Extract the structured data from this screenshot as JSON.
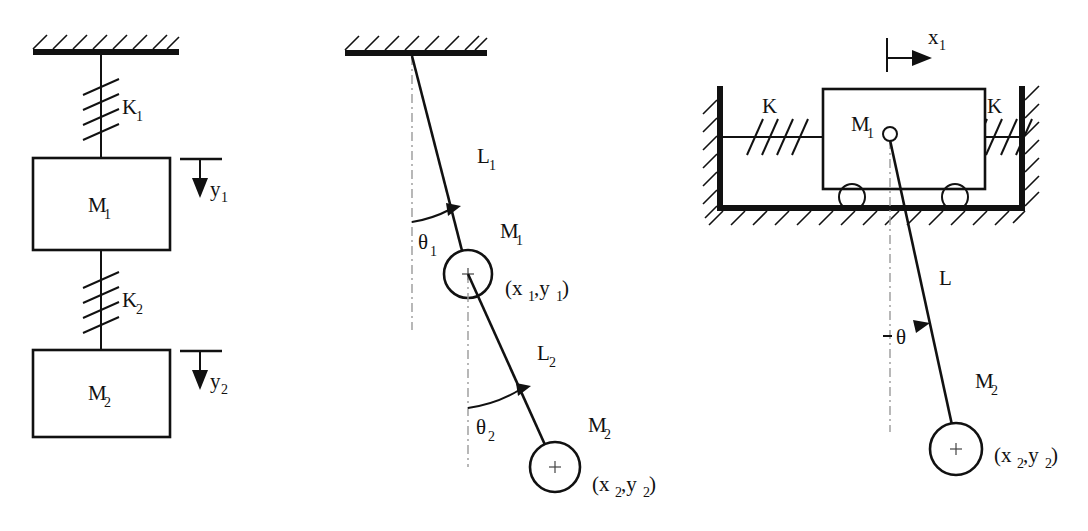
{
  "figure": {
    "title": "",
    "background_color": "#ffffff",
    "line_color": "#111111",
    "reference_line_color": "#9a9a9a"
  },
  "panels": [
    {
      "id": "panel-spring-mass",
      "name": "two-degree-of-freedom spring mass system",
      "labels": {
        "spring_1": "K",
        "spring_1_sub": "1",
        "spring_2": "K",
        "spring_2_sub": "2",
        "mass_1": "M",
        "mass_1_sub": "1",
        "mass_2": "M",
        "mass_2_sub": "2",
        "coord_1": "y",
        "coord_1_sub": "1",
        "coord_2": "y",
        "coord_2_sub": "2"
      }
    },
    {
      "id": "panel-double-pendulum",
      "name": "double pendulum",
      "labels": {
        "length_1": "L",
        "length_1_sub": "1",
        "length_2": "L",
        "length_2_sub": "2",
        "angle_1": "θ",
        "angle_1_sub": "1",
        "angle_2": "θ",
        "angle_2_sub": "2",
        "mass_1": "M",
        "mass_1_sub": "1",
        "mass_2": "M",
        "mass_2_sub": "2",
        "coord_1_open": "(x",
        "coord_1_sub_a": "1",
        "coord_1_mid": ",y",
        "coord_1_sub_b": "1",
        "coord_1_close": ")",
        "coord_2_open": "(x",
        "coord_2_sub_a": "2",
        "coord_2_mid": ",y",
        "coord_2_sub_b": "2",
        "coord_2_close": ")"
      }
    },
    {
      "id": "panel-cart-pendulum",
      "name": "spring restrained cart with pendulum",
      "labels": {
        "spring_left": "K",
        "spring_right": "K",
        "cart_mass": "M",
        "cart_mass_sub": "1",
        "cart_coord": "x",
        "cart_coord_sub": "1",
        "rod_length": "L",
        "angle": "θ",
        "bob_mass": "M",
        "bob_mass_sub": "2",
        "bob_coord_open": "(x",
        "bob_coord_sub_a": "2",
        "bob_coord_mid": ",y",
        "bob_coord_sub_b": "2",
        "bob_coord_close": ")"
      }
    }
  ]
}
